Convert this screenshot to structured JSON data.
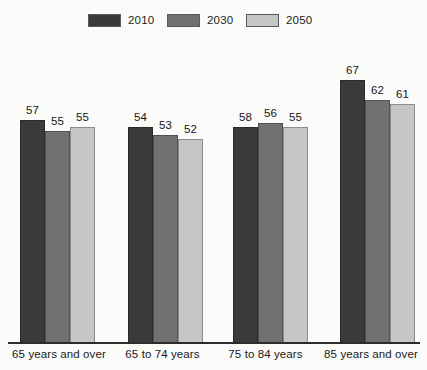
{
  "chart_data": {
    "type": "bar",
    "title": "",
    "subtitle": "",
    "xlabel": "",
    "ylabel": "",
    "grid": false,
    "legend_position": "top",
    "categories": [
      "65 years and over",
      "65 to 74 years",
      "75 to 84 years",
      "85 years and over"
    ],
    "series": [
      {
        "name": "2010",
        "color": "#3a3a3a",
        "values": [
          57,
          55,
          55,
          67
        ]
      },
      {
        "name": "2030",
        "color": "#717171",
        "values": [
          54,
          53,
          56,
          62
        ]
      },
      {
        "name": "2050",
        "color": "#c6c6c6",
        "values": [
          55,
          52,
          55,
          61
        ]
      }
    ],
    "value_labels": [
      [
        "57",
        "55",
        "55"
      ],
      [
        "54",
        "53",
        "52"
      ],
      [
        "58",
        "56",
        "55"
      ],
      [
        "67",
        "62",
        "61"
      ]
    ],
    "ylim": [
      0,
      75
    ],
    "axis_line_color": "#2c2c2c"
  },
  "legend": {
    "items": [
      {
        "label": "2010",
        "color": "#3a3a3a"
      },
      {
        "label": "2030",
        "color": "#717171"
      },
      {
        "label": "2050",
        "color": "#c6c6c6"
      }
    ]
  },
  "axis": {
    "categories": [
      {
        "label": "65 years and over"
      },
      {
        "label": "65 to 74 years"
      },
      {
        "label": "75 to 84 years"
      },
      {
        "label": "85 years and over"
      }
    ]
  }
}
